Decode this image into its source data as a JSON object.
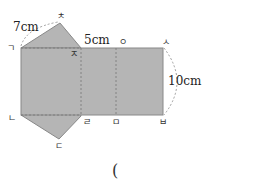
{
  "diagram": {
    "type": "prism-net",
    "fill_color": "#b5b5b5",
    "edge_color": "#888888",
    "vertices": {
      "g": {
        "label": "ㄱ"
      },
      "n": {
        "label": "ㄴ"
      },
      "d": {
        "label": "ㄷ"
      },
      "r": {
        "label": "ㄹ"
      },
      "m": {
        "label": "ㅁ"
      },
      "b": {
        "label": "ㅂ"
      },
      "s": {
        "label": "ㅅ"
      },
      "o": {
        "label": "ㅇ"
      },
      "j": {
        "label": "ㅈ"
      },
      "ch": {
        "label": "ㅊ"
      }
    },
    "dimensions": {
      "slant_edge": "7cm",
      "top_edge": "5cm",
      "height": "10cm"
    }
  },
  "answer": {
    "open_paren": "("
  }
}
